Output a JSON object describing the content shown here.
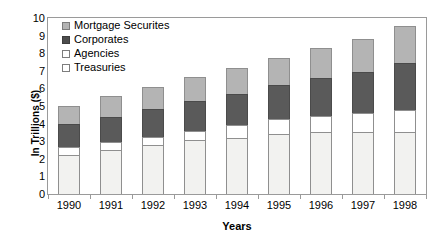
{
  "chart_data": {
    "type": "bar",
    "stacked": true,
    "title": "",
    "xlabel": "Years",
    "ylabel": "In Trillions ($)",
    "ylim": [
      0,
      10
    ],
    "yticks": [
      0,
      1,
      2,
      3,
      4,
      5,
      6,
      7,
      8,
      9,
      10
    ],
    "grid": false,
    "legend_position": "top-left inside plot",
    "categories": [
      "1990",
      "1991",
      "1992",
      "1993",
      "1994",
      "1995",
      "1996",
      "1997",
      "1998"
    ],
    "series": [
      {
        "name": "Treasuries",
        "color": "#f2f2f0",
        "values": [
          2.2,
          2.5,
          2.8,
          3.05,
          3.2,
          3.4,
          3.55,
          3.55,
          3.5
        ]
      },
      {
        "name": "Agencies",
        "color": "#ffffff",
        "values": [
          0.45,
          0.45,
          0.45,
          0.55,
          0.75,
          0.85,
          0.9,
          1.05,
          1.3
        ]
      },
      {
        "name": "Corporates",
        "color": "#5a5a5a",
        "values": [
          1.35,
          1.45,
          1.6,
          1.7,
          1.75,
          1.95,
          2.15,
          2.35,
          2.65
        ]
      },
      {
        "name": "Mortgage Securites",
        "color": "#b4b4b4",
        "values": [
          1.0,
          1.15,
          1.25,
          1.35,
          1.45,
          1.55,
          1.7,
          1.85,
          2.1
        ]
      }
    ],
    "totals": [
      5.0,
      5.55,
      6.1,
      6.65,
      7.15,
      7.75,
      8.3,
      8.8,
      9.55
    ]
  },
  "legend": {
    "items": [
      {
        "label": "Mortgage Securites",
        "swatch": "mortgage"
      },
      {
        "label": "Corporates",
        "swatch": "corporates"
      },
      {
        "label": "Agencies",
        "swatch": "agencies"
      },
      {
        "label": "Treasuries",
        "swatch": "treasuries"
      }
    ]
  }
}
